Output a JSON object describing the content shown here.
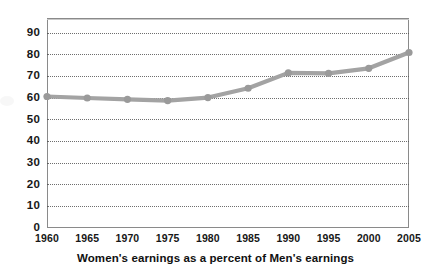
{
  "chart_data": {
    "type": "line",
    "title": "",
    "caption": "Women's earnings as a percent of Men's earnings",
    "xlabel": "",
    "ylabel": "",
    "x": [
      1960,
      1965,
      1970,
      1975,
      1980,
      1985,
      1990,
      1995,
      2000,
      2005
    ],
    "categories": [
      "1960",
      "1965",
      "1970",
      "1975",
      "1980",
      "1985",
      "1990",
      "1995",
      "2000",
      "2005"
    ],
    "values": [
      60.7,
      60.0,
      59.4,
      58.8,
      60.2,
      64.5,
      71.6,
      71.4,
      73.7,
      81.0
    ],
    "series": [
      {
        "name": "Women's earnings as a percent of Men's earnings",
        "values": [
          60.7,
          60.0,
          59.4,
          58.8,
          60.2,
          64.5,
          71.6,
          71.4,
          73.7,
          81.0
        ]
      }
    ],
    "xlim": [
      1960,
      2005
    ],
    "ylim": [
      0,
      96.8
    ],
    "ytick_labels": [
      "90",
      "80",
      "70",
      "60",
      "50",
      "40",
      "30",
      "20",
      "10",
      "0"
    ],
    "ytick_values": [
      90,
      80,
      70,
      60,
      50,
      40,
      30,
      20,
      10,
      0
    ],
    "xtick_labels": [
      "1960",
      "1965",
      "1970",
      "1975",
      "1980",
      "1985",
      "1990",
      "1995",
      "2000",
      "2005"
    ],
    "grid": "horizontal-dotted",
    "legend": "none",
    "line_color": "#a3a3a3",
    "marker_color": "#9a9a9a",
    "marker_shape": "circle",
    "axis_color": "#8a8a8a",
    "text_color": "#171717",
    "background": "#ffffff"
  }
}
